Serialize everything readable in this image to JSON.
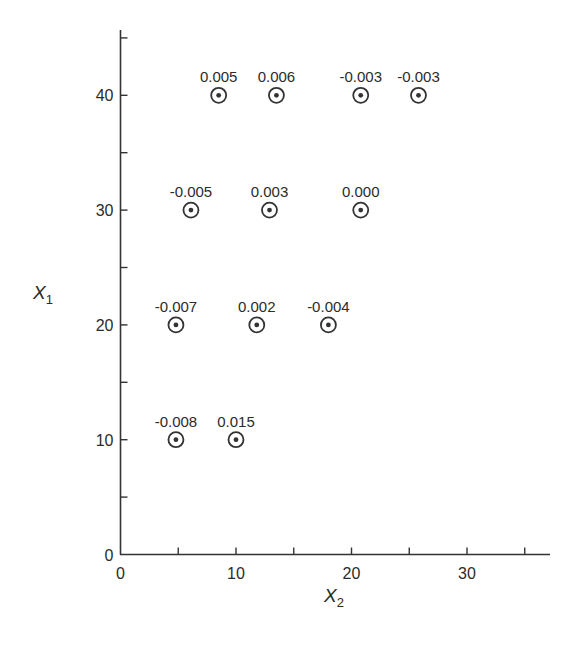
{
  "chart_data": {
    "type": "scatter",
    "title": "",
    "xlabel": "X",
    "xlabel_subscript": "2",
    "ylabel": "X",
    "ylabel_subscript": "1",
    "xlim": [
      0,
      37
    ],
    "ylim": [
      0,
      46
    ],
    "x_major_ticks": [
      0,
      10,
      20,
      30
    ],
    "x_minor_ticks": [
      5,
      15,
      25,
      35
    ],
    "y_major_ticks": [
      0,
      10,
      20,
      30,
      40
    ],
    "y_minor_ticks": [
      5,
      15,
      25,
      35,
      45
    ],
    "grid": false,
    "legend": null,
    "marker": "circle-with-center-dot",
    "points": [
      {
        "x": 8.5,
        "y": 40,
        "label": "0.005"
      },
      {
        "x": 13.5,
        "y": 40,
        "label": "0.006"
      },
      {
        "x": 20.8,
        "y": 40,
        "label": "-0.003"
      },
      {
        "x": 25.8,
        "y": 40,
        "label": "-0.003"
      },
      {
        "x": 6.1,
        "y": 30,
        "label": "-0.005"
      },
      {
        "x": 12.9,
        "y": 30,
        "label": "0.003"
      },
      {
        "x": 20.8,
        "y": 30,
        "label": "0.000"
      },
      {
        "x": 4.8,
        "y": 20,
        "label": "-0.007"
      },
      {
        "x": 11.8,
        "y": 20,
        "label": "0.002"
      },
      {
        "x": 18.0,
        "y": 20,
        "label": "-0.004"
      },
      {
        "x": 4.8,
        "y": 10,
        "label": "-0.008"
      },
      {
        "x": 10.0,
        "y": 10,
        "label": "0.015"
      }
    ]
  },
  "colors": {
    "ink": "#333333",
    "background": "#ffffff"
  }
}
